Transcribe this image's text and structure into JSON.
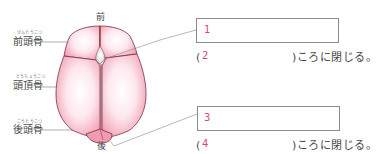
{
  "diagram": {
    "directions": {
      "front": "前",
      "back": "後"
    },
    "bones": [
      {
        "name": "前頭骨",
        "furigana": "ぜんとうこつ"
      },
      {
        "name": "頭頂骨",
        "furigana": "とうちょうこつ"
      },
      {
        "name": "後頭骨",
        "furigana": "こうとうこつ"
      }
    ]
  },
  "questions": [
    {
      "box_number": "1",
      "blank_number": "2",
      "open_paren": "(",
      "sentence_tail": ")ころに閉じる。"
    },
    {
      "box_number": "3",
      "blank_number": "4",
      "open_paren": "(",
      "sentence_tail": ")ころに閉じる。"
    }
  ],
  "colors": {
    "bone_fill": "#f4a9bb",
    "bone_edge": "#7a3040",
    "accent_number": "#d9487a",
    "box_border": "#8a8a8a"
  }
}
